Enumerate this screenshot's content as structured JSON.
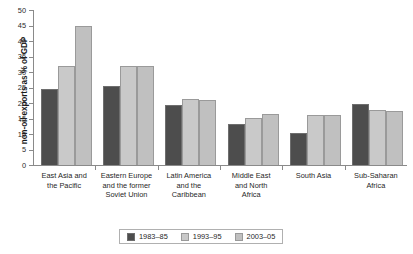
{
  "chart_data": {
    "type": "bar",
    "title": "",
    "xlabel": "",
    "ylabel": "non-oil exports as % of GDP",
    "ylim": [
      0,
      50
    ],
    "ytick_labels": [
      "50",
      "45",
      "40",
      "35",
      "30",
      "25",
      "20",
      "15",
      "10",
      "5",
      "0"
    ],
    "ytick_values": [
      50,
      45,
      40,
      35,
      30,
      25,
      20,
      15,
      10,
      5,
      0
    ],
    "grid": false,
    "legend_position": "bottom-center",
    "categories": [
      "East Asia and the Pacific",
      "Eastern Europe and the former Soviet Union",
      "Latin America and the Caribbean",
      "Middle East and North Africa",
      "South Asia",
      "Sub-Saharan Africa"
    ],
    "category_lines": [
      [
        "East Asia and",
        "the Pacific"
      ],
      [
        "Eastern Europe",
        "and the former",
        "Soviet Union"
      ],
      [
        "Latin America",
        "and the",
        "Caribbean"
      ],
      [
        "Middle East",
        "and North",
        "Africa"
      ],
      [
        "South Asia"
      ],
      [
        "Sub-Saharan",
        "Africa"
      ]
    ],
    "series": [
      {
        "name": "1983–85",
        "color": "#4d4d4d",
        "values": [
          24.4,
          25.4,
          19.5,
          13.2,
          10.2,
          19.6
        ]
      },
      {
        "name": "1993–95",
        "color": "#c9c9c9",
        "values": [
          32.0,
          32.0,
          21.4,
          15.1,
          16.1,
          17.6
        ]
      },
      {
        "name": "2003–05",
        "color": "#c0c0c0",
        "values": [
          44.8,
          31.9,
          21.1,
          16.6,
          16.0,
          17.4
        ]
      }
    ]
  }
}
